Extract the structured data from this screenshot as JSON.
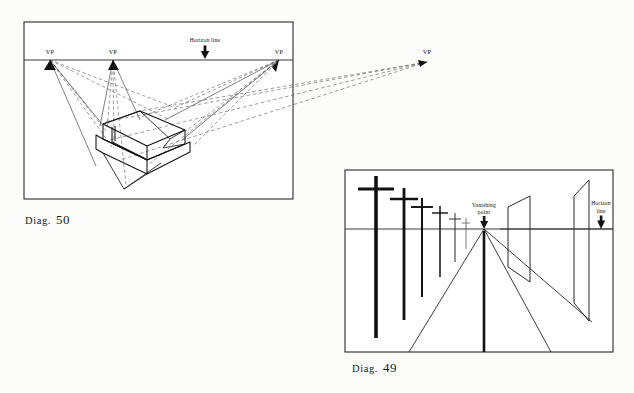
{
  "page": {
    "background_color": "#fcfcfa",
    "ink_color": "#111111",
    "construction_line_color": "#555555"
  },
  "figures": [
    {
      "id": "diag-50",
      "caption_smallcaps": "Diag.",
      "caption_number": "50",
      "frame": {
        "x": 24,
        "y": 22,
        "width": 269,
        "height": 177
      },
      "horizon": {
        "y": 60,
        "x1": 24,
        "x2": 293,
        "label": "Horizon line",
        "label_x": 205,
        "label_y": 42
      },
      "labels": {
        "horizon_line": "Horizon line",
        "vp": "VP"
      },
      "vanishing_points": [
        {
          "name": "vp-left",
          "label": "VP",
          "x": 50,
          "y": 60
        },
        {
          "name": "vp-center-left",
          "label": "VP",
          "x": 113,
          "y": 60
        },
        {
          "name": "vp-center-right",
          "label": "VP",
          "x": 279,
          "y": 60
        },
        {
          "name": "vp-far-right",
          "label": "VP",
          "x": 427,
          "y": 62
        }
      ],
      "description": "Four-point perspective construction of a solid block with dashed convergence lines running to four vanishing points on the horizon."
    },
    {
      "id": "diag-49",
      "caption_smallcaps": "Diag.",
      "caption_number": "49",
      "frame": {
        "x": 345,
        "y": 170,
        "width": 268,
        "height": 182
      },
      "horizon": {
        "y": 229,
        "x1": 345,
        "x2": 613
      },
      "labels": {
        "vanishing_point_line1": "Vanishing",
        "vanishing_point_line2": "point",
        "horizon_line1": "Horizon",
        "horizon_line2": "line"
      },
      "vanishing_point": {
        "x": 484,
        "y": 229
      },
      "poles": [
        {
          "index": 1,
          "x": 376,
          "top": 176,
          "bottom": 338,
          "arm_y": 189,
          "arm_half": 18,
          "stroke": 3.6
        },
        {
          "index": 2,
          "x": 404,
          "top": 188,
          "bottom": 320,
          "arm_y": 199,
          "arm_half": 14,
          "stroke": 2.8
        },
        {
          "index": 3,
          "x": 422,
          "top": 198,
          "bottom": 297,
          "arm_y": 207,
          "arm_half": 11,
          "stroke": 2.0
        },
        {
          "index": 4,
          "x": 440,
          "top": 206,
          "bottom": 277,
          "arm_y": 213,
          "arm_half": 8,
          "stroke": 1.5
        },
        {
          "index": 5,
          "x": 455,
          "top": 213,
          "bottom": 262,
          "arm_y": 219,
          "arm_half": 6,
          "stroke": 1.1
        },
        {
          "index": 6,
          "x": 466,
          "top": 218,
          "bottom": 249,
          "arm_y": 223,
          "arm_half": 4,
          "stroke": 0.8
        }
      ],
      "billboards": [
        {
          "index": 1,
          "points": "508,207 530,196 530,282 508,267"
        },
        {
          "index": 2,
          "points": "574,196 589,180 589,321 574,303"
        }
      ],
      "description": "One-point perspective: a receding row of telephone poles and two billboards diminish toward a single vanishing point on the horizon line, with road edge lines radiating from it."
    }
  ]
}
